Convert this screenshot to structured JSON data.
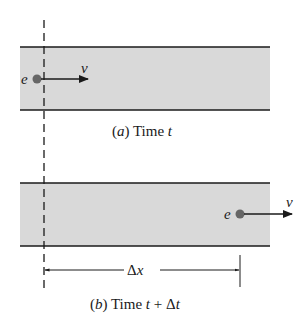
{
  "panel_a": {
    "particle_label": "e",
    "velocity_label": "v",
    "caption_prefix": "(",
    "caption_letter": "a",
    "caption_mid": ") Time ",
    "caption_var": "t"
  },
  "panel_b": {
    "particle_label": "e",
    "velocity_label": "v",
    "caption_prefix": "(",
    "caption_letter": "b",
    "caption_mid": ") Time ",
    "caption_var": "t",
    "caption_plus": " + Δ",
    "caption_var2": "t"
  },
  "displacement": {
    "delta": "Δ",
    "var": "x"
  },
  "colors": {
    "band_fill": "#d9d9d9",
    "line": "#1a1a1a",
    "particle": "#666666"
  }
}
